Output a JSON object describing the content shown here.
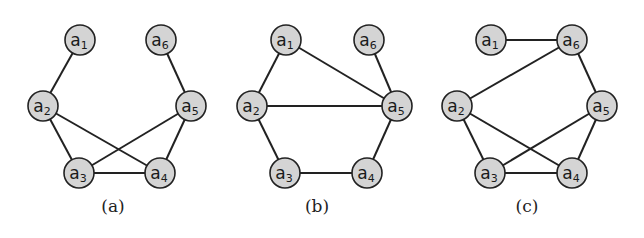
{
  "figure": {
    "panels": [
      {
        "caption": "(a)",
        "caption_pos": [
          113,
          212
        ],
        "nodes": [
          {
            "id": "a1",
            "base": "a",
            "sub": "1",
            "x": 80,
            "y": 40
          },
          {
            "id": "a6",
            "base": "a",
            "sub": "6",
            "x": 161,
            "y": 40
          },
          {
            "id": "a2",
            "base": "a",
            "sub": "2",
            "x": 43,
            "y": 106
          },
          {
            "id": "a5",
            "base": "a",
            "sub": "5",
            "x": 191,
            "y": 106
          },
          {
            "id": "a3",
            "base": "a",
            "sub": "3",
            "x": 79,
            "y": 173
          },
          {
            "id": "a4",
            "base": "a",
            "sub": "4",
            "x": 160,
            "y": 173
          }
        ],
        "edges": [
          [
            "a1",
            "a2"
          ],
          [
            "a6",
            "a5"
          ],
          [
            "a2",
            "a3"
          ],
          [
            "a2",
            "a4"
          ],
          [
            "a5",
            "a3"
          ],
          [
            "a5",
            "a4"
          ],
          [
            "a3",
            "a4"
          ]
        ]
      },
      {
        "caption": "(b)",
        "caption_pos": [
          317,
          212
        ],
        "nodes": [
          {
            "id": "a1",
            "base": "a",
            "sub": "1",
            "x": 286,
            "y": 40
          },
          {
            "id": "a6",
            "base": "a",
            "sub": "6",
            "x": 369,
            "y": 40
          },
          {
            "id": "a2",
            "base": "a",
            "sub": "2",
            "x": 252,
            "y": 106
          },
          {
            "id": "a5",
            "base": "a",
            "sub": "5",
            "x": 397,
            "y": 106
          },
          {
            "id": "a3",
            "base": "a",
            "sub": "3",
            "x": 285,
            "y": 173
          },
          {
            "id": "a4",
            "base": "a",
            "sub": "4",
            "x": 367,
            "y": 173
          }
        ],
        "edges": [
          [
            "a1",
            "a2"
          ],
          [
            "a1",
            "a5"
          ],
          [
            "a6",
            "a5"
          ],
          [
            "a2",
            "a5"
          ],
          [
            "a2",
            "a3"
          ],
          [
            "a3",
            "a4"
          ],
          [
            "a4",
            "a5"
          ]
        ]
      },
      {
        "caption": "(c)",
        "caption_pos": [
          527,
          212
        ],
        "nodes": [
          {
            "id": "a1",
            "base": "a",
            "sub": "1",
            "x": 491,
            "y": 40
          },
          {
            "id": "a6",
            "base": "a",
            "sub": "6",
            "x": 572,
            "y": 40
          },
          {
            "id": "a2",
            "base": "a",
            "sub": "2",
            "x": 457,
            "y": 106
          },
          {
            "id": "a5",
            "base": "a",
            "sub": "5",
            "x": 602,
            "y": 106
          },
          {
            "id": "a3",
            "base": "a",
            "sub": "3",
            "x": 490,
            "y": 173
          },
          {
            "id": "a4",
            "base": "a",
            "sub": "4",
            "x": 572,
            "y": 173
          }
        ],
        "edges": [
          [
            "a1",
            "a6"
          ],
          [
            "a6",
            "a2"
          ],
          [
            "a6",
            "a5"
          ],
          [
            "a2",
            "a3"
          ],
          [
            "a2",
            "a4"
          ],
          [
            "a5",
            "a3"
          ],
          [
            "a5",
            "a4"
          ],
          [
            "a3",
            "a4"
          ]
        ]
      }
    ],
    "node_radius": 15,
    "colors": {
      "node_fill": "#d4d4d4",
      "stroke": "#222222"
    }
  }
}
